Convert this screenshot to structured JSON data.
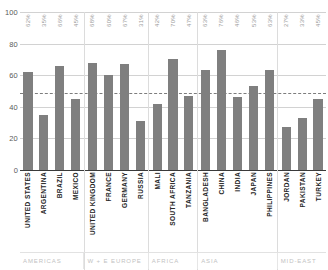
{
  "chart_data": {
    "type": "bar",
    "title": "",
    "xlabel": "",
    "ylabel": "",
    "ylim": [
      0,
      100
    ],
    "yticks": [
      0,
      20,
      40,
      60,
      80,
      100
    ],
    "grid": true,
    "legend": "none",
    "reference_line": {
      "value": 49,
      "style": "dashed"
    },
    "bar_color": "#7f7f7f",
    "categories": [
      "UNITED STATES",
      "ARGENTINA",
      "BRAZIL",
      "MEXICO",
      "UNITED KINGDOM",
      "FRANCE",
      "GERMANY",
      "RUSSIA",
      "MALI",
      "SOUTH AFRICA",
      "TANZANIA",
      "BANGLADESH",
      "CHINA",
      "INDIA",
      "JAPAN",
      "PHILIPPINES",
      "JORDAN",
      "PAKISTAN",
      "TURKEY"
    ],
    "values": [
      62,
      35,
      66,
      45,
      68,
      60,
      67,
      31,
      42,
      70,
      47,
      63,
      76,
      46,
      53,
      63,
      27,
      33,
      45
    ],
    "value_labels": [
      "62%",
      "35%",
      "66%",
      "45%",
      "68%",
      "60%",
      "67%",
      "31%",
      "42%",
      "70%",
      "47%",
      "63%",
      "76%",
      "46%",
      "53%",
      "63%",
      "27%",
      "33%",
      "45%"
    ],
    "panels": [
      {
        "region": "AMERICAS",
        "start": 0,
        "count": 4
      },
      {
        "region": "W + E  EUROPE",
        "start": 4,
        "count": 4
      },
      {
        "region": "AFRICA",
        "start": 8,
        "count": 3
      },
      {
        "region": "ASIA",
        "start": 11,
        "count": 5
      },
      {
        "region": "MID-EAST",
        "start": 16,
        "count": 3
      }
    ]
  }
}
